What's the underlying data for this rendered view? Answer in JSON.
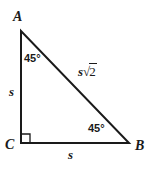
{
  "figure": {
    "type": "right-triangle-45-45-90",
    "background_color": "#ffffff",
    "stroke_color": "#1a1a1a",
    "stroke_width": 2,
    "vertices": {
      "A": {
        "label": "A",
        "x": 21,
        "y": 31
      },
      "C": {
        "label": "C",
        "x": 21,
        "y": 143
      },
      "B": {
        "label": "B",
        "x": 129,
        "y": 143
      }
    },
    "sides": {
      "leg_ac": {
        "label": "s",
        "from": "A",
        "to": "C"
      },
      "leg_cb": {
        "label": "s",
        "from": "C",
        "to": "B"
      },
      "hypotenuse": {
        "label": "s√2",
        "variable": "s",
        "radical_sign": "√",
        "radicand": "2",
        "from": "A",
        "to": "B"
      }
    },
    "angles": {
      "at_A": {
        "label": "45°",
        "value": 45
      },
      "at_B": {
        "label": "45°",
        "value": 45
      },
      "at_C": {
        "label": "",
        "value": 90,
        "marker": "right-angle-square"
      }
    }
  }
}
